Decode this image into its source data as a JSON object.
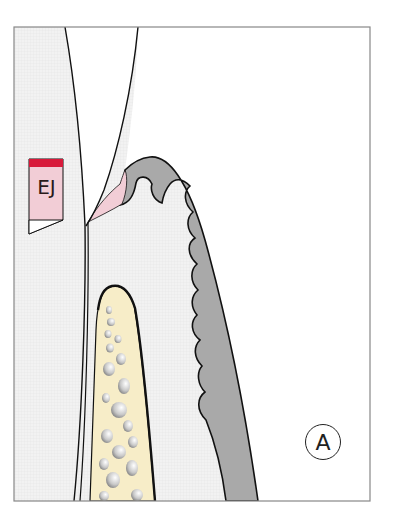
{
  "figure": {
    "panel_label": "A",
    "legend_label": "EJ",
    "colors": {
      "background": "#ffffff",
      "soft_tissue": "#eeeeee",
      "gingiva": "#a9a9a9",
      "junctional_epithelium": "#f2cdd6",
      "epithelial_band": "#d8193a",
      "bone": "#f7edc8",
      "bone_marrow": "#8a8a8a",
      "outline": "#111111",
      "frame": "#888888"
    }
  }
}
